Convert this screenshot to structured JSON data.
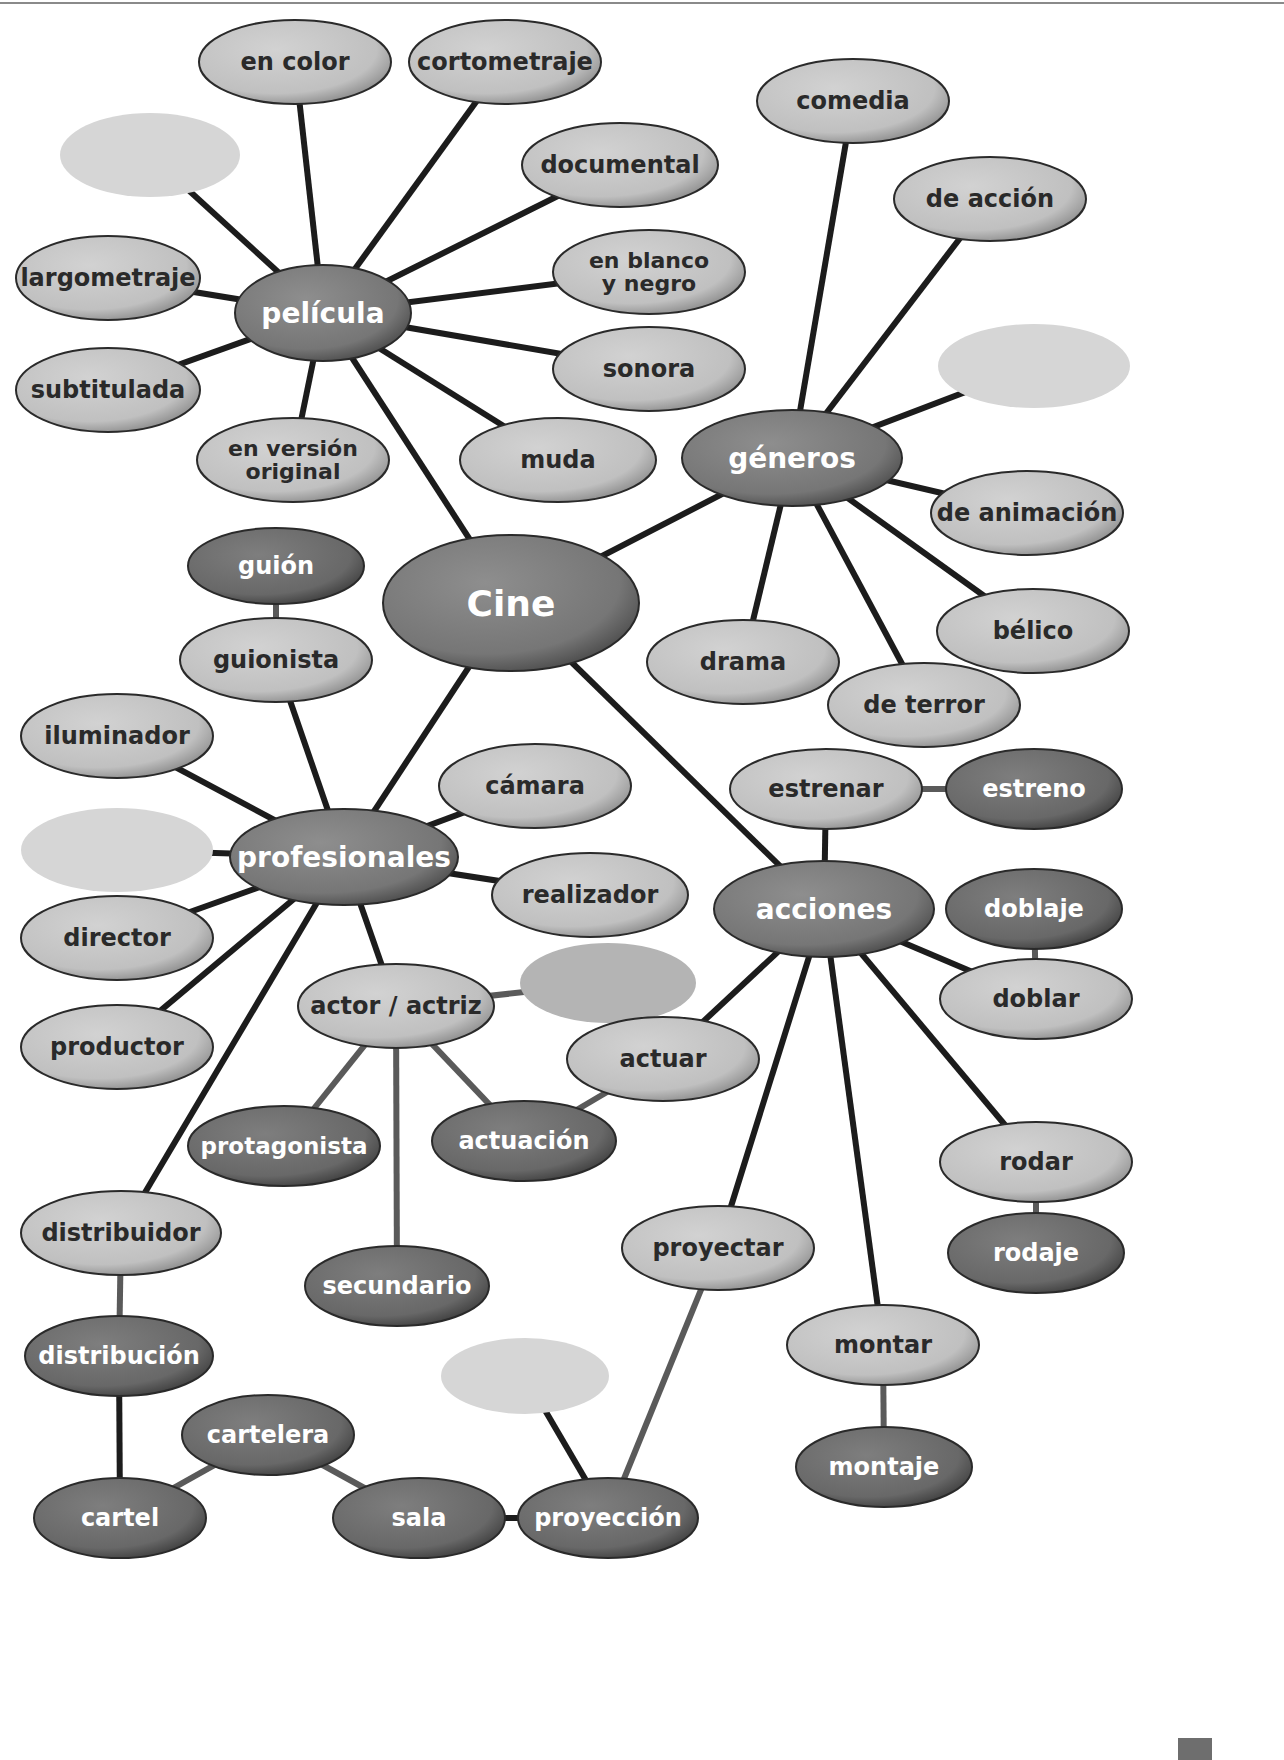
{
  "title": "Cine",
  "colors": {
    "background": "#ffffff",
    "line": "#1c1c1c",
    "line_gray": "#5a5a5a",
    "dark_fill": "#7a7a7a",
    "dark_fill_light": "#9a9a9a",
    "dark_text": "#ffffff",
    "light_fill": "#c4c4c4",
    "light_fill_light": "#dedede",
    "light_text": "#2a2a2a",
    "mid_fill": "#6c6c6c",
    "blank_fill": "#d6d6d6",
    "blank_mid_fill": "#b4b4b4",
    "outline": "#2a2a2a"
  },
  "nodes": [
    {
      "id": "cine",
      "label": "Cine",
      "x": 511,
      "y": 603,
      "rx": 128,
      "ry": 68,
      "style": "dark",
      "size": 36
    },
    {
      "id": "pelicula",
      "label": "película",
      "x": 323,
      "y": 313,
      "rx": 88,
      "ry": 48,
      "style": "dark",
      "size": 28
    },
    {
      "id": "en-color",
      "label": "en color",
      "x": 295,
      "y": 62,
      "rx": 96,
      "ry": 42,
      "style": "light",
      "size": 24
    },
    {
      "id": "cortometraje",
      "label": "cortometraje",
      "x": 505,
      "y": 62,
      "rx": 96,
      "ry": 42,
      "style": "light",
      "size": 24
    },
    {
      "id": "blank-pelicula",
      "label": "",
      "x": 150,
      "y": 155,
      "rx": 90,
      "ry": 42,
      "style": "blank",
      "size": 24
    },
    {
      "id": "documental",
      "label": "documental",
      "x": 620,
      "y": 165,
      "rx": 98,
      "ry": 42,
      "style": "light",
      "size": 24
    },
    {
      "id": "largometraje",
      "label": "largometraje",
      "x": 108,
      "y": 278,
      "rx": 92,
      "ry": 42,
      "style": "light",
      "size": 24
    },
    {
      "id": "en-blanco-y-negro",
      "label": "en blanco|y negro",
      "x": 649,
      "y": 272,
      "rx": 96,
      "ry": 42,
      "style": "light",
      "size": 22
    },
    {
      "id": "sonora",
      "label": "sonora",
      "x": 649,
      "y": 369,
      "rx": 96,
      "ry": 42,
      "style": "light",
      "size": 24
    },
    {
      "id": "subtitulada",
      "label": "subtitulada",
      "x": 108,
      "y": 390,
      "rx": 92,
      "ry": 42,
      "style": "light",
      "size": 24
    },
    {
      "id": "en-version-original",
      "label": "en versión|original",
      "x": 293,
      "y": 460,
      "rx": 96,
      "ry": 42,
      "style": "light",
      "size": 22
    },
    {
      "id": "muda",
      "label": "muda",
      "x": 558,
      "y": 460,
      "rx": 98,
      "ry": 42,
      "style": "light",
      "size": 24
    },
    {
      "id": "generos",
      "label": "géneros",
      "x": 792,
      "y": 458,
      "rx": 110,
      "ry": 48,
      "style": "dark",
      "size": 28
    },
    {
      "id": "comedia",
      "label": "comedia",
      "x": 853,
      "y": 101,
      "rx": 96,
      "ry": 42,
      "style": "light",
      "size": 24
    },
    {
      "id": "de-accion",
      "label": "de acción",
      "x": 990,
      "y": 199,
      "rx": 96,
      "ry": 42,
      "style": "light",
      "size": 24
    },
    {
      "id": "blank-generos",
      "label": "",
      "x": 1034,
      "y": 366,
      "rx": 96,
      "ry": 42,
      "style": "blank",
      "size": 24
    },
    {
      "id": "de-animacion",
      "label": "de animación",
      "x": 1027,
      "y": 513,
      "rx": 96,
      "ry": 42,
      "style": "light",
      "size": 24
    },
    {
      "id": "belico",
      "label": "bélico",
      "x": 1033,
      "y": 631,
      "rx": 96,
      "ry": 42,
      "style": "light",
      "size": 24
    },
    {
      "id": "drama",
      "label": "drama",
      "x": 743,
      "y": 662,
      "rx": 96,
      "ry": 42,
      "style": "light",
      "size": 24
    },
    {
      "id": "de-terror",
      "label": "de terror",
      "x": 924,
      "y": 705,
      "rx": 96,
      "ry": 42,
      "style": "light",
      "size": 24
    },
    {
      "id": "profesionales",
      "label": "profesionales",
      "x": 344,
      "y": 857,
      "rx": 114,
      "ry": 48,
      "style": "dark",
      "size": 28
    },
    {
      "id": "guion",
      "label": "guión",
      "x": 276,
      "y": 566,
      "rx": 88,
      "ry": 38,
      "style": "mid",
      "size": 24
    },
    {
      "id": "guionista",
      "label": "guionista",
      "x": 276,
      "y": 660,
      "rx": 96,
      "ry": 42,
      "style": "light",
      "size": 24
    },
    {
      "id": "iluminador",
      "label": "iluminador",
      "x": 117,
      "y": 736,
      "rx": 96,
      "ry": 42,
      "style": "light",
      "size": 24
    },
    {
      "id": "camara",
      "label": "cámara",
      "x": 535,
      "y": 786,
      "rx": 96,
      "ry": 42,
      "style": "light",
      "size": 24
    },
    {
      "id": "blank-profesionales",
      "label": "",
      "x": 117,
      "y": 850,
      "rx": 96,
      "ry": 42,
      "style": "blank",
      "size": 24
    },
    {
      "id": "realizador",
      "label": "realizador",
      "x": 590,
      "y": 895,
      "rx": 98,
      "ry": 42,
      "style": "light",
      "size": 24
    },
    {
      "id": "director",
      "label": "director",
      "x": 117,
      "y": 938,
      "rx": 96,
      "ry": 42,
      "style": "light",
      "size": 24
    },
    {
      "id": "actor-actriz",
      "label": "actor / actriz",
      "x": 396,
      "y": 1006,
      "rx": 98,
      "ry": 42,
      "style": "light",
      "size": 24
    },
    {
      "id": "blank-actor",
      "label": "",
      "x": 608,
      "y": 983,
      "rx": 88,
      "ry": 40,
      "style": "blank-mid",
      "size": 24
    },
    {
      "id": "productor",
      "label": "productor",
      "x": 117,
      "y": 1047,
      "rx": 96,
      "ry": 42,
      "style": "light",
      "size": 24
    },
    {
      "id": "protagonista",
      "label": "protagonista",
      "x": 284,
      "y": 1146,
      "rx": 96,
      "ry": 40,
      "style": "mid",
      "size": 23
    },
    {
      "id": "actuacion",
      "label": "actuación",
      "x": 524,
      "y": 1141,
      "rx": 92,
      "ry": 40,
      "style": "mid",
      "size": 24
    },
    {
      "id": "secundario",
      "label": "secundario",
      "x": 397,
      "y": 1286,
      "rx": 92,
      "ry": 40,
      "style": "mid",
      "size": 24
    },
    {
      "id": "distribuidor",
      "label": "distribuidor",
      "x": 121,
      "y": 1233,
      "rx": 100,
      "ry": 42,
      "style": "light",
      "size": 24
    },
    {
      "id": "distribucion",
      "label": "distribución",
      "x": 119,
      "y": 1356,
      "rx": 94,
      "ry": 40,
      "style": "mid",
      "size": 24
    },
    {
      "id": "cartelera",
      "label": "cartelera",
      "x": 268,
      "y": 1435,
      "rx": 86,
      "ry": 40,
      "style": "mid",
      "size": 24
    },
    {
      "id": "cartel",
      "label": "cartel",
      "x": 120,
      "y": 1518,
      "rx": 86,
      "ry": 40,
      "style": "mid",
      "size": 24
    },
    {
      "id": "sala",
      "label": "sala",
      "x": 419,
      "y": 1518,
      "rx": 86,
      "ry": 40,
      "style": "mid",
      "size": 24
    },
    {
      "id": "proyeccion",
      "label": "proyección",
      "x": 608,
      "y": 1518,
      "rx": 90,
      "ry": 40,
      "style": "mid",
      "size": 24
    },
    {
      "id": "blank-proyeccion",
      "label": "",
      "x": 525,
      "y": 1376,
      "rx": 84,
      "ry": 38,
      "style": "blank",
      "size": 24
    },
    {
      "id": "acciones",
      "label": "acciones",
      "x": 824,
      "y": 909,
      "rx": 110,
      "ry": 48,
      "style": "dark",
      "size": 28
    },
    {
      "id": "estrenar",
      "label": "estrenar",
      "x": 826,
      "y": 789,
      "rx": 96,
      "ry": 40,
      "style": "light",
      "size": 24
    },
    {
      "id": "estreno",
      "label": "estreno",
      "x": 1034,
      "y": 789,
      "rx": 88,
      "ry": 40,
      "style": "mid",
      "size": 24
    },
    {
      "id": "doblaje",
      "label": "doblaje",
      "x": 1034,
      "y": 909,
      "rx": 88,
      "ry": 40,
      "style": "mid",
      "size": 24
    },
    {
      "id": "doblar",
      "label": "doblar",
      "x": 1036,
      "y": 999,
      "rx": 96,
      "ry": 40,
      "style": "light",
      "size": 24
    },
    {
      "id": "actuar",
      "label": "actuar",
      "x": 663,
      "y": 1059,
      "rx": 96,
      "ry": 42,
      "style": "light",
      "size": 24
    },
    {
      "id": "rodar",
      "label": "rodar",
      "x": 1036,
      "y": 1162,
      "rx": 96,
      "ry": 40,
      "style": "light",
      "size": 24
    },
    {
      "id": "rodaje",
      "label": "rodaje",
      "x": 1036,
      "y": 1253,
      "rx": 88,
      "ry": 40,
      "style": "mid",
      "size": 24
    },
    {
      "id": "proyectar",
      "label": "proyectar",
      "x": 718,
      "y": 1248,
      "rx": 96,
      "ry": 42,
      "style": "light",
      "size": 24
    },
    {
      "id": "montar",
      "label": "montar",
      "x": 883,
      "y": 1345,
      "rx": 96,
      "ry": 40,
      "style": "light",
      "size": 24
    },
    {
      "id": "montaje",
      "label": "montaje",
      "x": 884,
      "y": 1467,
      "rx": 88,
      "ry": 40,
      "style": "mid",
      "size": 24
    }
  ],
  "edges": [
    [
      "cine",
      "pelicula",
      "dark"
    ],
    [
      "cine",
      "generos",
      "dark"
    ],
    [
      "cine",
      "profesionales",
      "dark"
    ],
    [
      "cine",
      "acciones",
      "dark"
    ],
    [
      "pelicula",
      "en-color",
      "dark"
    ],
    [
      "pelicula",
      "cortometraje",
      "dark"
    ],
    [
      "pelicula",
      "blank-pelicula",
      "dark"
    ],
    [
      "pelicula",
      "documental",
      "dark"
    ],
    [
      "pelicula",
      "largometraje",
      "dark"
    ],
    [
      "pelicula",
      "en-blanco-y-negro",
      "dark"
    ],
    [
      "pelicula",
      "sonora",
      "dark"
    ],
    [
      "pelicula",
      "subtitulada",
      "dark"
    ],
    [
      "pelicula",
      "en-version-original",
      "dark"
    ],
    [
      "pelicula",
      "muda",
      "dark"
    ],
    [
      "generos",
      "comedia",
      "dark"
    ],
    [
      "generos",
      "de-accion",
      "dark"
    ],
    [
      "generos",
      "blank-generos",
      "dark"
    ],
    [
      "generos",
      "de-animacion",
      "dark"
    ],
    [
      "generos",
      "belico",
      "dark"
    ],
    [
      "generos",
      "drama",
      "dark"
    ],
    [
      "generos",
      "de-terror",
      "dark"
    ],
    [
      "profesionales",
      "guionista",
      "dark"
    ],
    [
      "guionista",
      "guion",
      "gray"
    ],
    [
      "profesionales",
      "iluminador",
      "dark"
    ],
    [
      "profesionales",
      "camara",
      "dark"
    ],
    [
      "profesionales",
      "blank-profesionales",
      "dark"
    ],
    [
      "profesionales",
      "realizador",
      "dark"
    ],
    [
      "profesionales",
      "director",
      "dark"
    ],
    [
      "profesionales",
      "actor-actriz",
      "dark"
    ],
    [
      "profesionales",
      "productor",
      "dark"
    ],
    [
      "profesionales",
      "distribuidor",
      "dark"
    ],
    [
      "actor-actriz",
      "blank-actor",
      "gray"
    ],
    [
      "actor-actriz",
      "protagonista",
      "gray"
    ],
    [
      "actor-actriz",
      "actuacion",
      "gray"
    ],
    [
      "actor-actriz",
      "secundario",
      "gray"
    ],
    [
      "actuar",
      "actuacion",
      "gray"
    ],
    [
      "distribuidor",
      "distribucion",
      "gray"
    ],
    [
      "distribucion",
      "cartel",
      "dark"
    ],
    [
      "cartel",
      "cartelera",
      "gray"
    ],
    [
      "cartelera",
      "sala",
      "gray"
    ],
    [
      "sala",
      "proyeccion",
      "dark"
    ],
    [
      "proyeccion",
      "blank-proyeccion",
      "dark"
    ],
    [
      "proyeccion",
      "proyectar",
      "gray"
    ],
    [
      "acciones",
      "estrenar",
      "dark"
    ],
    [
      "estrenar",
      "estreno",
      "gray"
    ],
    [
      "acciones",
      "doblar",
      "dark"
    ],
    [
      "doblar",
      "doblaje",
      "gray"
    ],
    [
      "acciones",
      "actuar",
      "dark"
    ],
    [
      "acciones",
      "rodar",
      "dark"
    ],
    [
      "rodar",
      "rodaje",
      "gray"
    ],
    [
      "acciones",
      "proyectar",
      "dark"
    ],
    [
      "acciones",
      "montar",
      "dark"
    ],
    [
      "montar",
      "montaje",
      "gray"
    ]
  ]
}
